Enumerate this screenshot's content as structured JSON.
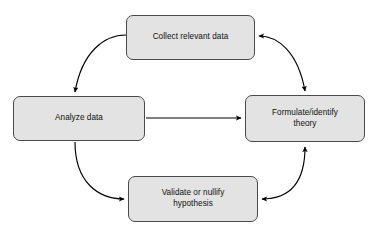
{
  "diagram": {
    "type": "cycle-flowchart",
    "background_color": "#ffffff",
    "node_fill_color": "#e3e3e3",
    "node_border_color": "#4a4a4a",
    "arrow_color": "#000000",
    "text_color": "#101010",
    "nodes": [
      {
        "id": "collect",
        "label": "Collect relevant data",
        "position": "top"
      },
      {
        "id": "analyze",
        "label": "Analyze data",
        "position": "left"
      },
      {
        "id": "formulate",
        "label": "Formulate/identify\ntheory",
        "position": "right"
      },
      {
        "id": "validate",
        "label": "Validate or nullify\nhypothesis",
        "position": "bottom"
      }
    ],
    "connectors": [
      {
        "id": "collect-to-analyze",
        "from": "collect",
        "to": "analyze",
        "style": "curved",
        "heads": "single"
      },
      {
        "id": "collect-formulate",
        "from": "formulate",
        "to": "collect",
        "style": "curved",
        "heads": "double"
      },
      {
        "id": "analyze-to-formulate",
        "from": "analyze",
        "to": "formulate",
        "style": "straight",
        "heads": "single"
      },
      {
        "id": "analyze-to-validate",
        "from": "analyze",
        "to": "validate",
        "style": "curved",
        "heads": "single"
      },
      {
        "id": "validate-formulate",
        "from": "validate",
        "to": "formulate",
        "style": "curved",
        "heads": "double"
      }
    ]
  }
}
